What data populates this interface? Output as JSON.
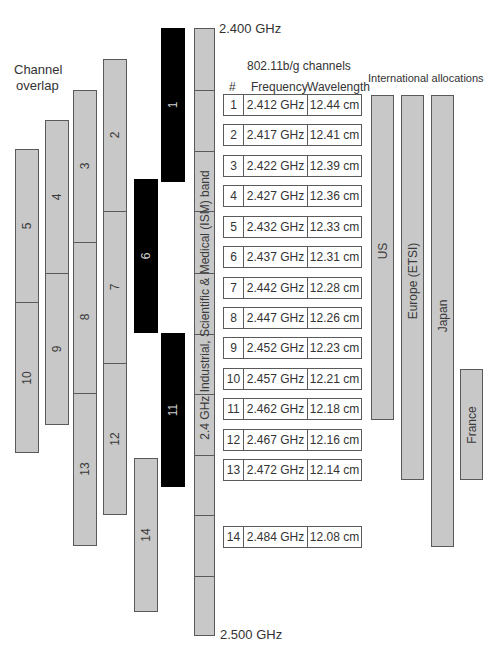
{
  "labels": {
    "top_freq": "2.400 GHz",
    "bottom_freq": "2.500 GHz",
    "channel_overlap_line1": "Channel",
    "channel_overlap_line2": "overlap",
    "table_title": "802.11b/g channels",
    "international_title": "International allocations",
    "ism_band": "2.4 GHz Industrial, Scientific & Medical (ISM) band"
  },
  "table": {
    "headers": [
      "#",
      "Frequency",
      "Wavelength"
    ],
    "rows": [
      {
        "ch": "1",
        "freq": "2.412 GHz",
        "wl": "12.44 cm"
      },
      {
        "ch": "2",
        "freq": "2.417 GHz",
        "wl": "12.41 cm"
      },
      {
        "ch": "3",
        "freq": "2.422 GHz",
        "wl": "12.39 cm"
      },
      {
        "ch": "4",
        "freq": "2.427 GHz",
        "wl": "12.36 cm"
      },
      {
        "ch": "5",
        "freq": "2.432 GHz",
        "wl": "12.33 cm"
      },
      {
        "ch": "6",
        "freq": "2.437 GHz",
        "wl": "12.31 cm"
      },
      {
        "ch": "7",
        "freq": "2.442 GHz",
        "wl": "12.28 cm"
      },
      {
        "ch": "8",
        "freq": "2.447 GHz",
        "wl": "12.26 cm"
      },
      {
        "ch": "9",
        "freq": "2.452 GHz",
        "wl": "12.23 cm"
      },
      {
        "ch": "10",
        "freq": "2.457 GHz",
        "wl": "12.21 cm"
      },
      {
        "ch": "11",
        "freq": "2.462 GHz",
        "wl": "12.18 cm"
      },
      {
        "ch": "12",
        "freq": "2.467 GHz",
        "wl": "12.16 cm"
      },
      {
        "ch": "13",
        "freq": "2.472 GHz",
        "wl": "12.14 cm"
      },
      {
        "ch": "14",
        "freq": "2.484 GHz",
        "wl": "12.08 cm"
      }
    ]
  },
  "channels": {
    "c1": "1",
    "c2": "2",
    "c3": "3",
    "c4": "4",
    "c5": "5",
    "c6": "6",
    "c7": "7",
    "c8": "8",
    "c9": "9",
    "c10": "10",
    "c11": "11",
    "c12": "12",
    "c13": "13",
    "c14": "14",
    "non_overlapping": [
      "1",
      "6",
      "11"
    ]
  },
  "allocations": {
    "us": "US",
    "europe": "Europe (ETSI)",
    "japan": "Japan",
    "france": "France"
  },
  "colors": {
    "bar_gray": "#c8c8c8",
    "bar_black": "#000000",
    "border": "#5a5a5a"
  }
}
